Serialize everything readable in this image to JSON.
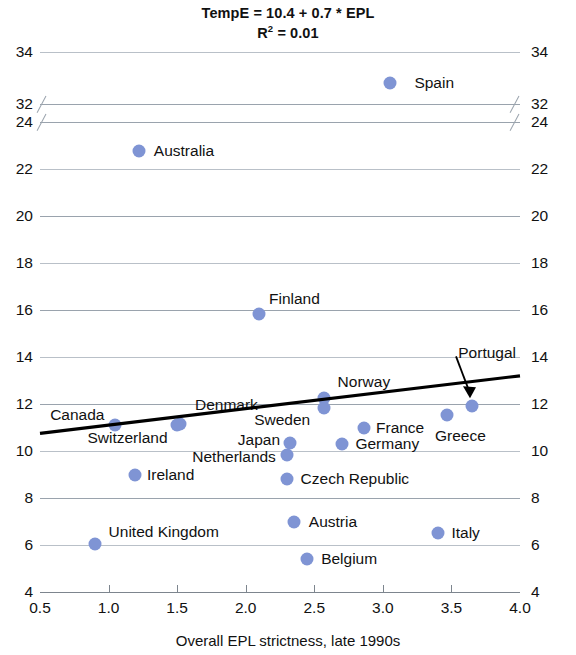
{
  "chart_data": {
    "type": "scatter",
    "title": "TempE = 10.4 + 0.7 * EPL",
    "subtitle_prefix": "R",
    "subtitle_sup": "2",
    "subtitle_rest": " = 0.01",
    "xlabel": "Overall EPL strictness, late 1990s",
    "ylabel": "",
    "xlim": [
      0.5,
      4.0
    ],
    "ylim": [
      4,
      34
    ],
    "grid": true,
    "legend": "none",
    "axis_break": {
      "below": 24,
      "above": 32,
      "note": "y-axis broken between 24 and 32"
    },
    "xticks": [
      "0.5",
      "1.0",
      "1.5",
      "2.0",
      "2.5",
      "3.0",
      "3.5",
      "4.0"
    ],
    "xtick_values": [
      0.5,
      1.0,
      1.5,
      2.0,
      2.5,
      3.0,
      3.5,
      4.0
    ],
    "yticks": [
      "34",
      "32",
      "24",
      "22",
      "20",
      "18",
      "16",
      "14",
      "12",
      "10",
      "8",
      "6",
      "4"
    ],
    "ytick_values": [
      34,
      32,
      24,
      22,
      20,
      18,
      16,
      14,
      12,
      10,
      8,
      6,
      4
    ],
    "trendline": {
      "equation": "TempE = 10.4 + 0.7 * EPL",
      "intercept": 10.4,
      "slope": 0.7,
      "r_squared": 0.01,
      "x_start": 0.5,
      "x_end": 4.0,
      "y_start": 10.75,
      "y_end": 13.2
    },
    "annotation": {
      "label": "Portugal",
      "target_x": 3.65,
      "target_y": 11.9
    },
    "colors": {
      "marker": "#7f94d4",
      "trendline": "#000000",
      "gridline": "#9aa3ad",
      "text": "#111111"
    },
    "points": [
      {
        "label": "Spain",
        "x": 3.05,
        "y": 32.8,
        "lx": 3.23,
        "ly": 32.8,
        "align": "right"
      },
      {
        "label": "Australia",
        "x": 1.22,
        "y": 22.75,
        "lx": 1.33,
        "ly": 22.75,
        "align": "right"
      },
      {
        "label": "Finland",
        "x": 2.1,
        "y": 15.85,
        "lx": 2.17,
        "ly": 16.45,
        "align": "right"
      },
      {
        "label": "Norway",
        "x": 2.57,
        "y": 12.25,
        "lx": 2.67,
        "ly": 12.95,
        "align": "right"
      },
      {
        "label": "Portugal",
        "x": 3.65,
        "y": 11.9,
        "lx": 3.55,
        "ly": 14.15,
        "align": "right"
      },
      {
        "label": "Greece",
        "x": 3.47,
        "y": 11.55,
        "lx": 3.38,
        "ly": 10.65,
        "align": "right"
      },
      {
        "label": "Sweden",
        "x": 2.57,
        "y": 11.85,
        "lx": 2.47,
        "ly": 11.3,
        "align": "left"
      },
      {
        "label": "Denmark",
        "x": 1.52,
        "y": 11.15,
        "lx": 1.63,
        "ly": 11.95,
        "align": "right"
      },
      {
        "label": "Canada",
        "x": 1.05,
        "y": 11.1,
        "lx": 0.97,
        "ly": 11.55,
        "align": "left"
      },
      {
        "label": "Switzerland",
        "x": 1.5,
        "y": 11.12,
        "lx": 1.43,
        "ly": 10.55,
        "align": "left"
      },
      {
        "label": "France",
        "x": 2.86,
        "y": 11.0,
        "lx": 2.95,
        "ly": 11.0,
        "align": "right"
      },
      {
        "label": "Germany",
        "x": 2.7,
        "y": 10.3,
        "lx": 2.8,
        "ly": 10.3,
        "align": "right"
      },
      {
        "label": "Japan",
        "x": 2.32,
        "y": 10.35,
        "lx": 2.25,
        "ly": 10.45,
        "align": "left"
      },
      {
        "label": "Netherlands",
        "x": 2.3,
        "y": 9.85,
        "lx": 2.22,
        "ly": 9.75,
        "align": "left"
      },
      {
        "label": "Ireland",
        "x": 1.19,
        "y": 9.0,
        "lx": 1.28,
        "ly": 9.0,
        "align": "right"
      },
      {
        "label": "Czech Republic",
        "x": 2.3,
        "y": 8.8,
        "lx": 2.4,
        "ly": 8.8,
        "align": "right"
      },
      {
        "label": "Austria",
        "x": 2.35,
        "y": 7.0,
        "lx": 2.46,
        "ly": 7.0,
        "align": "right"
      },
      {
        "label": "Italy",
        "x": 3.4,
        "y": 6.5,
        "lx": 3.5,
        "ly": 6.5,
        "align": "right"
      },
      {
        "label": "United Kingdom",
        "x": 0.9,
        "y": 6.05,
        "lx": 1.0,
        "ly": 6.55,
        "align": "right"
      },
      {
        "label": "Belgium",
        "x": 2.45,
        "y": 5.4,
        "lx": 2.55,
        "ly": 5.4,
        "align": "right"
      }
    ]
  }
}
